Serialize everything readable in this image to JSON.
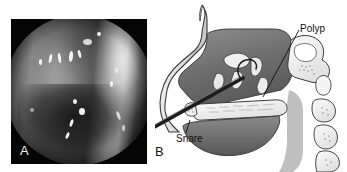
{
  "figure": {
    "width": 347,
    "height": 172,
    "background_color": "#ffffff",
    "type": "two-panel medical figure"
  },
  "panels": [
    {
      "letter": "A",
      "name": "endoscopic-photograph",
      "description": "Grayscale nasal endoscopy photograph with circular field of view on black background",
      "background_color": "#050505",
      "letter_color": "#f0f0f0"
    },
    {
      "letter": "B",
      "name": "sagittal-anatomy-diagram",
      "description": "Grayscale sagittal section line drawing of the nasal cavity showing polyps and a snare instrument",
      "background_color": "#ffffff",
      "letter_color": "#151515"
    }
  ],
  "annotations": [
    {
      "id": "polyp",
      "label": "Polyp",
      "leader_from": [
        299,
        30
      ],
      "leader_to": [
        263,
        97
      ]
    },
    {
      "id": "snare",
      "label": "Snare",
      "leader_from": [
        186,
        133
      ],
      "leader_to": [
        190,
        120
      ]
    }
  ],
  "colors": {
    "ink": "#101010",
    "diagram_outline": "#3a3a3a",
    "mucosa_dark": "#6f6f6f",
    "mucosa_mid": "#9a9a9a",
    "bone_light": "#e2e2e2",
    "cartilage": "#cfcfcf",
    "snare_instrument": "#1d1d1d",
    "photo_black": "#050505"
  }
}
